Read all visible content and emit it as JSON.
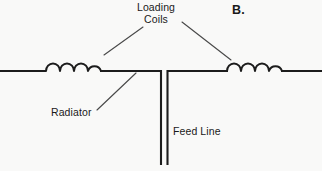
{
  "figure": {
    "section_label": "B.",
    "background_color": "#f9f9f8",
    "line_color": "#1c1c1c",
    "leader_color": "#4a4a4a",
    "width": 322,
    "height": 171
  },
  "labels": {
    "loading_coils_line1": "Loading",
    "loading_coils_line2": "Coils",
    "radiator": "Radiator",
    "feed_line": "Feed Line"
  },
  "components": {
    "left_coil": {
      "turns": 4,
      "start_x": 46,
      "end_x": 101,
      "baseline_y": 71
    },
    "right_coil": {
      "turns": 4,
      "start_x": 227,
      "end_x": 282,
      "baseline_y": 71
    },
    "left_radiator_wire": {
      "x1": 0,
      "x2": 46,
      "y": 71
    },
    "center_left_wire": {
      "x1": 101,
      "x2": 160,
      "y": 71
    },
    "center_right_wire": {
      "x1": 168,
      "x2": 227,
      "y": 71
    },
    "right_radiator_wire": {
      "x1": 282,
      "x2": 322,
      "y": 71
    },
    "feed_line_left": {
      "x": 160,
      "y1": 71,
      "y2": 165
    },
    "feed_line_right": {
      "x": 168,
      "y1": 71,
      "y2": 165
    }
  }
}
